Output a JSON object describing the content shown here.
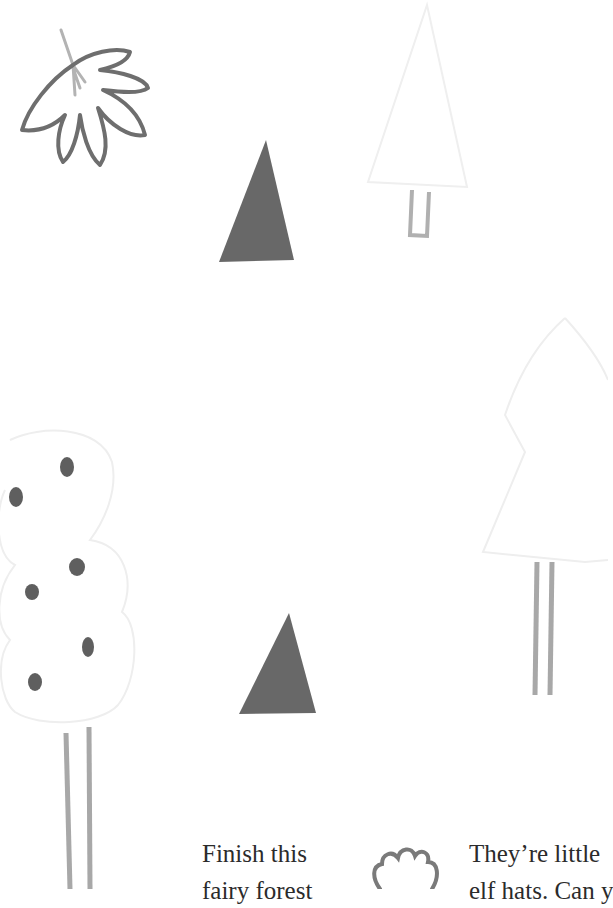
{
  "page": {
    "background": "#ffffff",
    "colors": {
      "dark_fill": "#686868",
      "leaf_outline": "#6e6e6e",
      "stem": "#a8a8a8",
      "faint_outline": "#ededed",
      "text": "#2b2b2b"
    }
  },
  "illustrations": {
    "leaf": "maple-leaf-sketch",
    "triangle_top": "dark-triangle-elf-hat",
    "triangle_bottom": "dark-triangle-elf-hat",
    "tree_top_right": "faint-triangle-tree-outline",
    "tree_right": "faint-layered-tree-outline",
    "tree_left": "faint-round-tree-with-dots",
    "flower": "flower-sketch"
  },
  "text": {
    "left_line1": "Finish this",
    "left_line2": "fairy forest",
    "right_line1": "They’re little",
    "right_line2": "elf hats. Can y"
  }
}
